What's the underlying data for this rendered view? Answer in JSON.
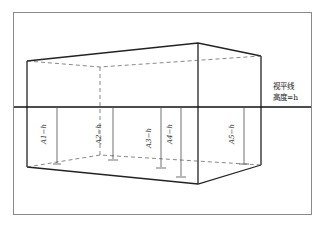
{
  "figure": {
    "eye_line_label_1": "视平线",
    "eye_line_label_2": "高度=h",
    "measurements": [
      {
        "label": "A1−h"
      },
      {
        "label": "A2−h"
      },
      {
        "label": "A3−h"
      },
      {
        "label": "A4−h"
      },
      {
        "label": "A5−h"
      }
    ]
  }
}
